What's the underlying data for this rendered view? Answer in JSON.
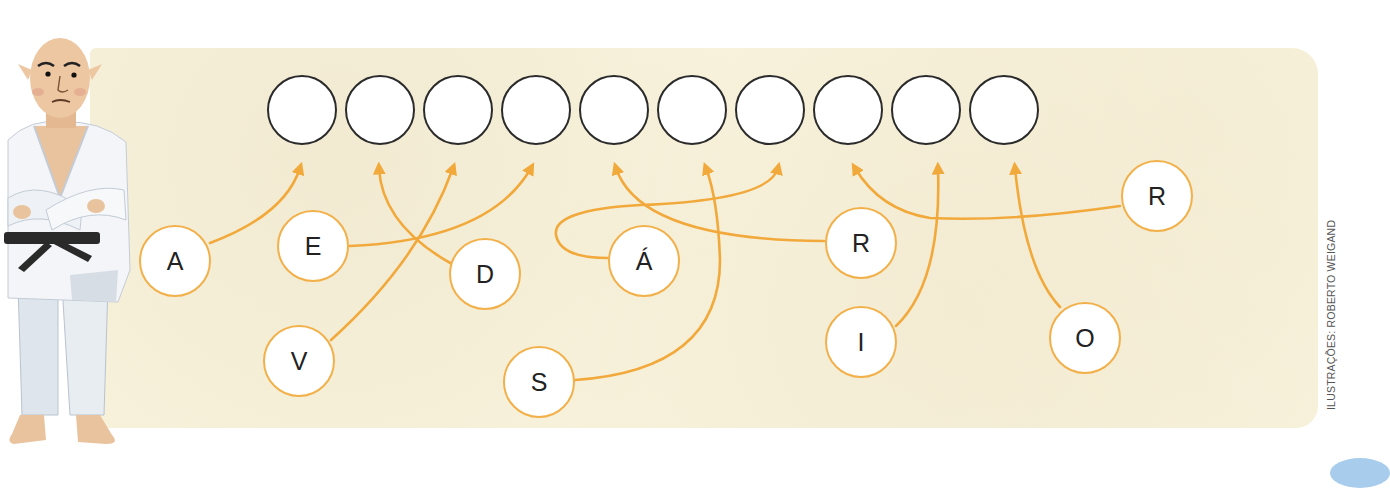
{
  "exercise": {
    "type": "letter-matching-word-puzzle",
    "answer_slots_count": 10,
    "answer_slots": [
      "",
      "",
      "",
      "",
      "",
      "",
      "",
      "",
      "",
      ""
    ],
    "letters": [
      {
        "id": "A",
        "char": "A",
        "target_slot": 1
      },
      {
        "id": "E",
        "char": "E",
        "target_slot": 4
      },
      {
        "id": "D",
        "char": "D",
        "target_slot": 2
      },
      {
        "id": "V",
        "char": "V",
        "target_slot": 3
      },
      {
        "id": "S",
        "char": "S",
        "target_slot": 6
      },
      {
        "id": "AA",
        "char": "Á",
        "target_slot": 7
      },
      {
        "id": "R1",
        "char": "R",
        "target_slot": 5
      },
      {
        "id": "I",
        "char": "I",
        "target_slot": 9
      },
      {
        "id": "R2",
        "char": "R",
        "target_slot": 8
      },
      {
        "id": "O",
        "char": "O",
        "target_slot": 10
      }
    ],
    "solution_word": "ADVERSÁRIO"
  },
  "character": {
    "description": "judoka in white gi with black belt, arms crossed"
  },
  "credit": "ILUSTRAÇÕES: ROBERTO WEIGAND",
  "colors": {
    "panel": "#f8f2dc",
    "arrow": "#f2a93b",
    "letter_border": "#f2b04a",
    "slot_border": "#2b2b2b"
  }
}
